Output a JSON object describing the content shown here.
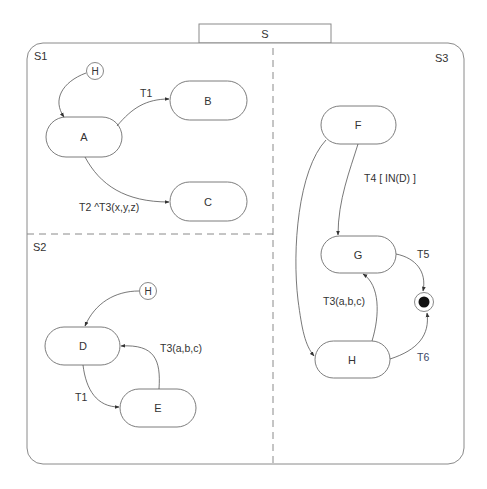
{
  "diagram": {
    "type": "statechart",
    "root_state": {
      "label": "S"
    },
    "regions": [
      {
        "id": "S1",
        "label": "S1"
      },
      {
        "id": "S2",
        "label": "S2"
      },
      {
        "id": "S3",
        "label": "S3"
      }
    ],
    "states": {
      "A": {
        "label": "A",
        "region": "S1"
      },
      "B": {
        "label": "B",
        "region": "S1"
      },
      "C": {
        "label": "C",
        "region": "S1"
      },
      "D": {
        "label": "D",
        "region": "S2"
      },
      "E": {
        "label": "E",
        "region": "S2"
      },
      "F": {
        "label": "F",
        "region": "S3"
      },
      "G": {
        "label": "G",
        "region": "S3"
      },
      "H": {
        "label": "H",
        "region": "S3"
      }
    },
    "history": {
      "s1": {
        "label": "H",
        "target": "A"
      },
      "s2": {
        "label": "H",
        "target": "D"
      }
    },
    "final_state": {
      "region": "S3"
    },
    "transitions": {
      "a_b": {
        "from": "A",
        "to": "B",
        "label": "T1"
      },
      "a_c": {
        "from": "A",
        "to": "C",
        "label": "T2 ^T3(x,y,z)"
      },
      "d_e": {
        "from": "D",
        "to": "E",
        "label": "T1"
      },
      "e_d": {
        "from": "E",
        "to": "D",
        "label": "T3(a,b,c)"
      },
      "f_g": {
        "from": "F",
        "to": "G",
        "label": "T4 [ IN(D) ]"
      },
      "f_h": {
        "from": "F",
        "to": "H",
        "label": ""
      },
      "h_g": {
        "from": "H",
        "to": "G",
        "label": "T3(a,b,c)"
      },
      "g_final": {
        "from": "G",
        "to": "final",
        "label": "T5"
      },
      "h_final": {
        "from": "H",
        "to": "final",
        "label": "T6"
      }
    },
    "colors": {
      "stroke": "#6e6e6e",
      "text": "#333333",
      "t6_label": "#3c4868",
      "final_dot": "#111111"
    }
  }
}
